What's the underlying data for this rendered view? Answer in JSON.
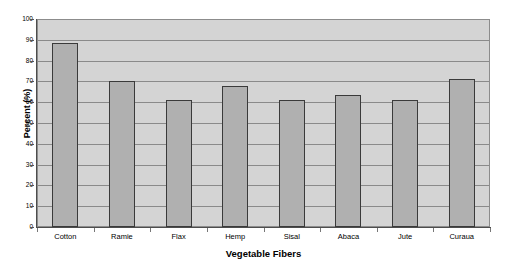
{
  "chart_data": {
    "type": "bar",
    "title": "",
    "xlabel": "Vegetable Fibers",
    "ylabel": "Percent (%)",
    "categories": [
      "Cotton",
      "Ramie",
      "Flax",
      "Hemp",
      "Sisal",
      "Abaca",
      "Jute",
      "Curaua"
    ],
    "values": [
      88.5,
      70,
      61,
      68,
      61,
      63.5,
      61,
      71
    ],
    "ylim": [
      0,
      100
    ],
    "yticks": [
      0,
      10,
      20,
      30,
      40,
      50,
      60,
      70,
      80,
      90,
      100
    ],
    "ytick_labels": [
      "0",
      "10",
      "20",
      "30",
      "40",
      "50",
      "60",
      "70",
      "80",
      "90",
      "100"
    ],
    "grid": true,
    "grid_axis": "y",
    "legend": false,
    "legend_position": "none",
    "series": [
      {
        "name": "Percent (%)",
        "values": [
          88.5,
          70,
          61,
          68,
          61,
          63.5,
          61,
          71
        ]
      }
    ],
    "colors": {
      "bar_fill": "#b0b0b0",
      "bar_edge": "#3a3a3a",
      "plot_background": "#d4d4d4",
      "gridline": "#8a8a8a",
      "axis": "#4d4d4d",
      "text": "#000000",
      "figure_background": "#ffffff"
    }
  }
}
